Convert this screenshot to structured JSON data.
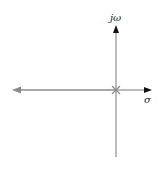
{
  "diagram": {
    "type": "root-locus s-plane",
    "axes": {
      "imaginary_label": "jω",
      "real_label": "σ"
    },
    "poles": [
      {
        "re": 0,
        "im": 0,
        "marker": "x"
      }
    ],
    "locus": {
      "from": "origin",
      "direction": "negative real axis",
      "color": "#8a8a8a"
    },
    "colors": {
      "axis": "#666666",
      "locus": "#8a8a8a",
      "arrow": "#111111"
    }
  }
}
